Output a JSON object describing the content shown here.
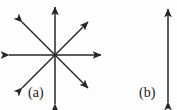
{
  "figure": {
    "kind": "vector-diagram",
    "background_color": "#fefefe",
    "stroke_color": "#262626",
    "canvas": {
      "width": 177,
      "height": 110
    },
    "panels": [
      {
        "id": "a",
        "label": "(a)",
        "label_position": {
          "x": 28,
          "y": 86
        },
        "description": "eight double-headed arrows radiating from a common center (isotropic / star pattern)",
        "center": {
          "x": 55,
          "y": 55
        },
        "arrow_count": 8,
        "arrowheads": "double",
        "arrows": [
          {
            "name": "vertical-arrow",
            "angle_deg": 90,
            "x1": 55,
            "y1": 105,
            "x2": 55,
            "y2": 6
          },
          {
            "name": "horizontal-arrow",
            "angle_deg": 0,
            "x1": 7,
            "y1": 55,
            "x2": 102,
            "y2": 55
          },
          {
            "name": "diagonal-arrow-nesw",
            "angle_deg": 45,
            "x1": 21,
            "y1": 89,
            "x2": 89,
            "y2": 21
          },
          {
            "name": "diagonal-arrow-nwse",
            "angle_deg": 135,
            "x1": 21,
            "y1": 21,
            "x2": 89,
            "y2": 89
          }
        ]
      },
      {
        "id": "b",
        "label": "(b)",
        "label_position": {
          "x": 139,
          "y": 86
        },
        "description": "a single vertical double-headed arrow (uniaxial / anisotropic)",
        "arrow_count": 1,
        "arrowheads": "double",
        "arrows": [
          {
            "name": "vertical-arrow",
            "angle_deg": 90,
            "x1": 168,
            "y1": 103,
            "x2": 168,
            "y2": 8
          }
        ]
      }
    ]
  }
}
